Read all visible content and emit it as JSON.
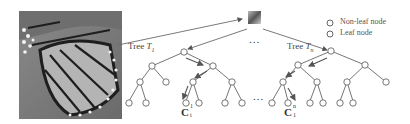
{
  "figure": {
    "image": {
      "name": "butterfly-wing-image",
      "description": "grayscale butterfly wing photo"
    },
    "patch": {
      "name": "image-patch"
    },
    "legend": {
      "items": [
        {
          "label": "Non-leaf node"
        },
        {
          "label": "Leaf node"
        }
      ]
    },
    "trees": [
      {
        "label_prefix": "Tree ",
        "label_var": "T",
        "label_sub": "1",
        "leaf_label_main": "C",
        "leaf_label_sup": "1",
        "leaf_label_sub": "i"
      },
      {
        "label_prefix": "Tree ",
        "label_var": "T",
        "label_sub": "n",
        "leaf_label_main": "C",
        "leaf_label_sup": "n",
        "leaf_label_sub": "1"
      }
    ],
    "ellipsis_top": "...",
    "ellipsis_middle": "...",
    "colors": {
      "line": "#6a6a6a",
      "node_stroke": "#555555",
      "arrow": "#555555",
      "text": "#444444"
    }
  }
}
